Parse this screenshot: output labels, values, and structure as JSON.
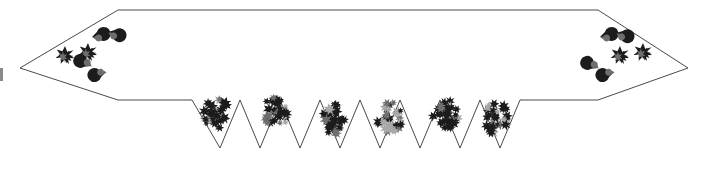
{
  "figure": {
    "title": "",
    "caption": "",
    "background_color": "#ffffff",
    "outline_color": "#4a4a4a",
    "outline_width": 1,
    "fill_color": "#ffffff",
    "cluster_dark_color": "#1c1c1c",
    "cluster_mid_color": "#6e6e6e",
    "cluster_light_color": "#a8a8a8",
    "edge_mark_color": "#8a8a8a",
    "width": 708,
    "height": 176
  },
  "shape": {
    "name": "double-headed-arrow-banner-with-sawtooth-base",
    "description": "Horizontal banner outline with pointed left and right arrow tips and a zigzag sawtooth lower edge",
    "points": "118,10 598,10 688,68 598,100 520,100 500,148 480,100 460,148 440,100 420,148 400,100 380,148 360,100 340,148 320,100 300,148 280,100 260,148 240,100 220,148 192,100 118,100 20,68",
    "left_tip": {
      "x": 20,
      "y": 68
    },
    "right_tip": {
      "x": 688,
      "y": 68
    },
    "top_left_corner": {
      "x": 118,
      "y": 10
    },
    "top_right_corner": {
      "x": 598,
      "y": 10
    },
    "bottom_left_corner": {
      "x": 118,
      "y": 100
    },
    "bottom_right_corner": {
      "x": 598,
      "y": 100
    },
    "sawtooth": {
      "start_x": 192,
      "end_x": 520,
      "baseline_y": 100,
      "valley_y": 148,
      "teeth": 6,
      "valleys_x": [
        220,
        260,
        300,
        340,
        380,
        420,
        460,
        500
      ],
      "peaks_x": [
        240,
        280,
        320,
        360,
        400,
        440,
        480
      ]
    }
  },
  "clusters": {
    "sawtooth_clusters": [
      {
        "id": "cluster-1",
        "cx": 216,
        "cy": 114,
        "scale": 1.0
      },
      {
        "id": "cluster-2",
        "cx": 276,
        "cy": 112,
        "scale": 1.0
      },
      {
        "id": "cluster-3",
        "cx": 332,
        "cy": 118,
        "scale": 1.0
      },
      {
        "id": "cluster-4",
        "cx": 390,
        "cy": 118,
        "scale": 1.0
      },
      {
        "id": "cluster-5",
        "cx": 446,
        "cy": 116,
        "scale": 1.0
      },
      {
        "id": "cluster-6",
        "cx": 496,
        "cy": 118,
        "scale": 1.0
      }
    ],
    "left_tip_group": {
      "stars": [
        {
          "id": "left-star-1",
          "cx": 65,
          "cy": 55,
          "r": 9
        },
        {
          "id": "left-star-2",
          "cx": 88,
          "cy": 52,
          "r": 9
        }
      ],
      "crescents": [
        {
          "id": "left-crescent-1",
          "cx": 92,
          "cy": 37,
          "r": 7,
          "rot": -20
        },
        {
          "id": "left-crescent-2",
          "cx": 108,
          "cy": 32,
          "r": 7,
          "rot": 10
        },
        {
          "id": "left-crescent-3",
          "cx": 91,
          "cy": 66,
          "r": 7,
          "rot": 200
        },
        {
          "id": "left-crescent-4",
          "cx": 106,
          "cy": 72,
          "r": 7,
          "rot": 160
        }
      ]
    },
    "right_tip_group": {
      "stars": [
        {
          "id": "right-star-1",
          "cx": 620,
          "cy": 55,
          "r": 9
        },
        {
          "id": "right-star-2",
          "cx": 643,
          "cy": 52,
          "r": 9
        }
      ],
      "crescents": [
        {
          "id": "right-crescent-1",
          "cx": 600,
          "cy": 37,
          "r": 7,
          "rot": -20
        },
        {
          "id": "right-crescent-2",
          "cx": 616,
          "cy": 33,
          "r": 7,
          "rot": 10
        },
        {
          "id": "right-crescent-3",
          "cx": 598,
          "cy": 68,
          "r": 7,
          "rot": 200
        },
        {
          "id": "right-crescent-4",
          "cx": 614,
          "cy": 72,
          "r": 7,
          "rot": 160
        }
      ]
    }
  },
  "edge_marks": [
    {
      "id": "left-edge-mark",
      "x": 0,
      "y": 68,
      "width": 3,
      "height": 13
    }
  ]
}
